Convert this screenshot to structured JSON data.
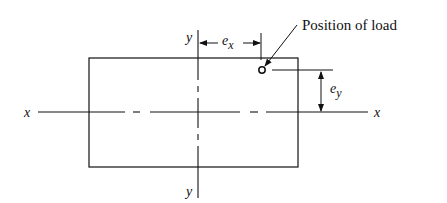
{
  "diagram": {
    "annotation": "Position of load",
    "axes": {
      "x_left": "x",
      "x_right": "x",
      "y_top": "y",
      "y_bottom": "y"
    },
    "dimensions": {
      "ex_base": "e",
      "ex_sub": "x",
      "ey_base": "e",
      "ey_sub": "y"
    }
  }
}
